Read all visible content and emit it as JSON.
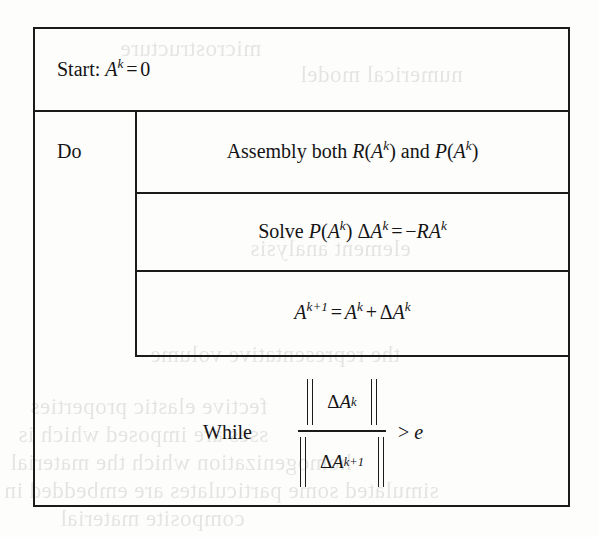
{
  "figure": {
    "kind": "algorithm-box",
    "colors": {
      "ink": "#1b1b1b",
      "paper": "#fdfdfc"
    }
  },
  "rows": {
    "start": {
      "label": "Start:",
      "variable": "A",
      "variable_sup": "k",
      "equals": "=",
      "value": "0",
      "full_text": "Start: A^k = 0"
    },
    "loop_label": "Do",
    "steps": [
      {
        "id": "assembly",
        "words_before": "Assembly both",
        "term1_fn": "R",
        "term1_arg": "A",
        "term1_sup": "k",
        "conjunction": "and",
        "term2_fn": "P",
        "term2_arg": "A",
        "term2_sup": "k",
        "full_text": "Assembly both R(A^k) and P(A^k)"
      },
      {
        "id": "solve",
        "words_before": "Solve",
        "matrix_fn": "P",
        "matrix_arg": "A",
        "matrix_sup": "k",
        "delta": "Δ",
        "unknown": "A",
        "unknown_sup": "k",
        "equals": "=",
        "rhs_sign": "−",
        "rhs_r": "R",
        "rhs_a": "A",
        "rhs_sup": "k",
        "full_text": "Solve P(A^k) ΔA^k = −RA^k"
      },
      {
        "id": "update",
        "lhs": "A",
        "lhs_sup": "k+1",
        "equals": "=",
        "rhs_a": "A",
        "rhs_a_sup": "k",
        "plus": "+",
        "delta": "Δ",
        "rhs_d": "A",
        "rhs_d_sup": "k",
        "full_text": "A^{k+1} = A^k + ΔA^k"
      }
    ],
    "while": {
      "label": "While",
      "numerator": {
        "delta": "Δ",
        "var": "A",
        "sup": "k",
        "text": "ΔA^k"
      },
      "denominator": {
        "delta": "Δ",
        "var": "A",
        "sup": "k+1",
        "text": "ΔA^{k+1}"
      },
      "comparator": ">",
      "tolerance": "e",
      "full_text": "While  ||ΔA^k|| / ||ΔA^{k+1}||  > e"
    }
  },
  "bleed_through": {
    "note": "faint mirrored show-through text from the reverse side of the scanned page",
    "lines": [
      {
        "text": "fective elastic properties",
        "x": 30,
        "y": 404
      },
      {
        "text": "sses are imposed which is",
        "x": 18,
        "y": 432
      },
      {
        "text": "homogenization which the material",
        "x": 10,
        "y": 460
      },
      {
        "text": "simulated some particulates are embedded in",
        "x": 4,
        "y": 488
      },
      {
        "text": "composite material",
        "x": 60,
        "y": 514
      },
      {
        "text": "microstructure",
        "x": 120,
        "y": 44
      },
      {
        "text": "numerical model",
        "x": 300,
        "y": 70
      },
      {
        "text": "the representative volume",
        "x": 150,
        "y": 350
      },
      {
        "text": "element analysis",
        "x": 250,
        "y": 244
      }
    ]
  }
}
